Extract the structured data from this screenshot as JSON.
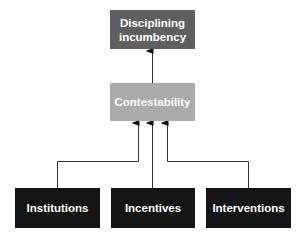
{
  "diagram": {
    "type": "flow",
    "direction": "bottom-to-top",
    "top_node": {
      "label": "Disciplining\nincumbency",
      "line1": "Disciplining",
      "line2": "incumbency",
      "color": "#5f5f5f"
    },
    "middle_node": {
      "label": "Contestability",
      "color": "#ababab"
    },
    "bottom_nodes": [
      {
        "label": "Institutions",
        "color": "#141414"
      },
      {
        "label": "Incentives",
        "color": "#141414"
      },
      {
        "label": "Interventions",
        "color": "#141414"
      }
    ],
    "edges": [
      {
        "from": "Contestability",
        "to": "Disciplining incumbency"
      },
      {
        "from": "Institutions",
        "to": "Contestability"
      },
      {
        "from": "Incentives",
        "to": "Contestability"
      },
      {
        "from": "Interventions",
        "to": "Contestability"
      }
    ]
  }
}
